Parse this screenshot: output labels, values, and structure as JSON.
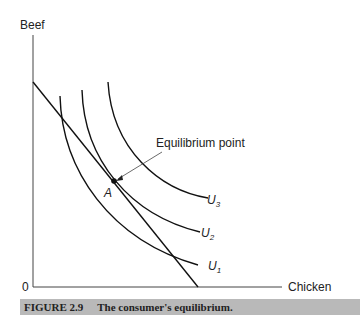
{
  "axes": {
    "y_label": "Beef",
    "x_label": "Chicken",
    "origin": "0"
  },
  "annotation": {
    "label": "Equilibrium point",
    "point": "A"
  },
  "curves": [
    {
      "name": "U",
      "sub": "1"
    },
    {
      "name": "U",
      "sub": "2"
    },
    {
      "name": "U",
      "sub": "3"
    }
  ],
  "caption": {
    "number": "FIGURE 2.9",
    "text": "The consumer's equilibrium."
  }
}
